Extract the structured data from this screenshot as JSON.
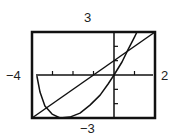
{
  "chart_data": {
    "type": "line",
    "title": "",
    "xlabel": "",
    "ylabel": "",
    "xlim": [
      -4,
      2
    ],
    "ylim": [
      -3,
      3
    ],
    "window_labels": {
      "xmin": "−4",
      "xmax": "2",
      "ymin": "−3",
      "ymax": "3"
    },
    "x_tick_step": 1,
    "y_tick_step": 1,
    "grid": false,
    "legend": null,
    "series": [
      {
        "name": "line",
        "x": [
          -4,
          2
        ],
        "y": [
          -3,
          3
        ]
      },
      {
        "name": "curve",
        "x": [
          -3.76,
          -3.61,
          -3.37,
          -3.02,
          -2.63,
          -2.15,
          -1.66,
          -1.17,
          -0.68,
          -0.29,
          0,
          0.39,
          0.68,
          0.98,
          1.12
        ],
        "y": [
          -0.07,
          -1.19,
          -2.17,
          -2.73,
          -3.0,
          -2.94,
          -2.66,
          -2.1,
          -1.4,
          -0.63,
          0,
          0.91,
          1.75,
          2.59,
          3.0
        ]
      }
    ]
  },
  "frame": {
    "left": 32,
    "top": 32,
    "right": 155,
    "bottom": 118,
    "color": "#111111"
  }
}
